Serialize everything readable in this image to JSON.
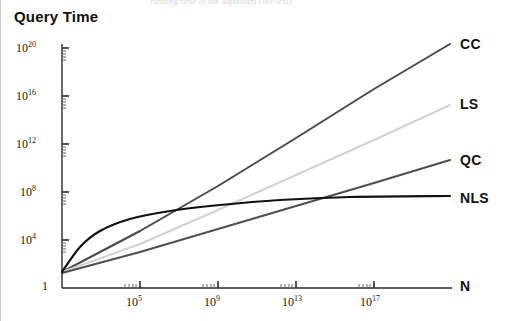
{
  "figure": {
    "title": "Query Time",
    "top_cut_text": "running time of the algorithm (see text)"
  },
  "chart_data": {
    "type": "line",
    "title": "Query Time",
    "xlabel": "N",
    "ylabel": "Query Time",
    "xscale": "log",
    "yscale": "log",
    "grid": false,
    "legend": "right-inline-labels",
    "xlim": [
      1,
      1e+20
    ],
    "ylim": [
      1,
      1e+21
    ],
    "x_ticks": [
      {
        "label": "10^5",
        "base": "10",
        "exp": "5",
        "value": 100000.0
      },
      {
        "label": "10^9",
        "base": "10",
        "exp": "9",
        "value": 1000000000.0
      },
      {
        "label": "10^13",
        "base": "10",
        "exp": "13",
        "value": 10000000000000.0
      },
      {
        "label": "10^17",
        "base": "10",
        "exp": "17",
        "value": 1e+17
      }
    ],
    "y_ticks": [
      {
        "label": "1",
        "base": "1",
        "exp": "",
        "value": 1
      },
      {
        "label": "10^4",
        "base": "10",
        "exp": "4",
        "value": 10000.0
      },
      {
        "label": "10^8",
        "base": "10",
        "exp": "8",
        "value": 100000000.0
      },
      {
        "label": "10^12",
        "base": "10",
        "exp": "12",
        "value": 1000000000000.0
      },
      {
        "label": "10^16",
        "base": "10",
        "exp": "16",
        "value": 1e+16
      },
      {
        "label": "10^20",
        "base": "10",
        "exp": "20",
        "value": 1e+20
      }
    ],
    "series": [
      {
        "name": "CC",
        "label": "CC",
        "color": "#4a4a4a",
        "shape": "straight",
        "description": "steepest straight line on log-log axes",
        "points_xy": [
          [
            62,
            272
          ],
          [
            140,
            231
          ],
          [
            218,
            186
          ],
          [
            296,
            138
          ],
          [
            374,
            89
          ],
          [
            450,
            44
          ]
        ]
      },
      {
        "name": "LS",
        "label": "LS",
        "color": "#d2d2d2",
        "shape": "straight",
        "description": "light grey straight line, second steepest",
        "points_xy": [
          [
            62,
            272
          ],
          [
            140,
            244
          ],
          [
            218,
            210
          ],
          [
            296,
            175
          ],
          [
            374,
            140
          ],
          [
            450,
            105
          ]
        ]
      },
      {
        "name": "QC",
        "label": "QC",
        "color": "#4f4f4f",
        "shape": "straight",
        "description": "medium-grey straight line, shallow slope",
        "points_xy": [
          [
            62,
            273
          ],
          [
            140,
            252
          ],
          [
            218,
            229
          ],
          [
            296,
            206
          ],
          [
            374,
            183
          ],
          [
            450,
            160
          ]
        ]
      },
      {
        "name": "NLS",
        "label": "NLS",
        "color": "#111111",
        "shape": "curved",
        "description": "black curve, rises steeply then flattens out",
        "points_xy": [
          [
            62,
            272
          ],
          [
            80,
            247
          ],
          [
            100,
            231
          ],
          [
            130,
            219
          ],
          [
            170,
            211
          ],
          [
            220,
            205
          ],
          [
            280,
            200
          ],
          [
            350,
            197
          ],
          [
            450,
            196
          ]
        ]
      }
    ],
    "axis_end_label": "N"
  },
  "y_axis_labels": [
    {
      "base": "10",
      "exp": "20",
      "top": 40
    },
    {
      "base": "10",
      "exp": "16",
      "top": 88
    },
    {
      "base": "10",
      "exp": "12",
      "top": 136
    },
    {
      "base": "10",
      "exp": "8",
      "top": 184
    },
    {
      "base": "10",
      "exp": "4",
      "top": 232
    },
    {
      "base": "1",
      "exp": "",
      "top": 278
    }
  ],
  "x_axis_labels": [
    {
      "base": "10",
      "exp": "5",
      "left": 126
    },
    {
      "base": "10",
      "exp": "9",
      "left": 204
    },
    {
      "base": "10",
      "exp": "13",
      "left": 282
    },
    {
      "base": "10",
      "exp": "17",
      "left": 360
    }
  ],
  "series_labels": [
    {
      "text": "CC",
      "left": 460,
      "top": 36
    },
    {
      "text": "LS",
      "left": 460,
      "top": 96
    },
    {
      "text": "QC",
      "left": 460,
      "top": 152
    },
    {
      "text": "NLS",
      "left": 460,
      "top": 190
    }
  ],
  "axis_end_label": {
    "text": "N",
    "left": 460,
    "top": 278
  }
}
